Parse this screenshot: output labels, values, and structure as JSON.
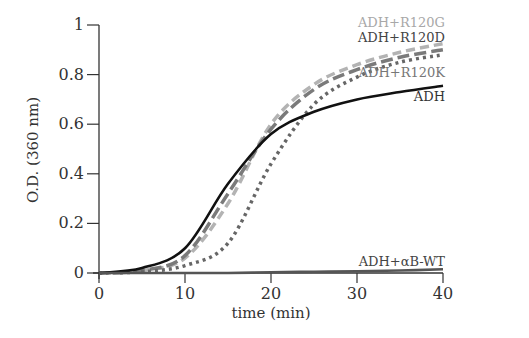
{
  "chart_data": {
    "type": "line",
    "title": "",
    "xlabel": "time (min)",
    "ylabel": "O.D. (360 nm)",
    "xlim": [
      0,
      40
    ],
    "ylim": [
      0,
      1
    ],
    "x_ticks": [
      0,
      10,
      20,
      30,
      40
    ],
    "y_ticks": [
      0,
      0.2,
      0.4,
      0.6,
      0.8,
      1
    ],
    "y_tick_labels": [
      "0",
      "0.2",
      "0.4",
      "0.6",
      "0.8",
      "1"
    ],
    "grid": false,
    "legend_position": "inline-right",
    "x": [
      0,
      5,
      10,
      15,
      20,
      25,
      30,
      35,
      40
    ],
    "series": [
      {
        "name": "ADH+R120G",
        "style": "dashed",
        "color": "#b3b3b3",
        "label_color": "#a8a8a8",
        "values": [
          0,
          0.01,
          0.06,
          0.28,
          0.6,
          0.76,
          0.84,
          0.89,
          0.925
        ]
      },
      {
        "name": "ADH+R120D",
        "style": "long-dashed",
        "color": "#7a7a7a",
        "label_color": "#444444",
        "values": [
          0,
          0.01,
          0.07,
          0.32,
          0.58,
          0.74,
          0.82,
          0.87,
          0.9
        ]
      },
      {
        "name": "ADH+R120K",
        "style": "dotted",
        "color": "#666666",
        "label_color": "#777777",
        "values": [
          0,
          0.005,
          0.03,
          0.12,
          0.44,
          0.68,
          0.79,
          0.85,
          0.88
        ]
      },
      {
        "name": "ADH",
        "style": "solid",
        "color": "#111111",
        "label_color": "#333333",
        "values": [
          0,
          0.02,
          0.1,
          0.36,
          0.56,
          0.65,
          0.7,
          0.73,
          0.755
        ]
      },
      {
        "name": "ADH+αB-WT",
        "style": "solid",
        "color": "#555555",
        "label_color": "#444444",
        "values": [
          0,
          0,
          0,
          0,
          0.003,
          0.005,
          0.007,
          0.01,
          0.015
        ]
      }
    ]
  }
}
